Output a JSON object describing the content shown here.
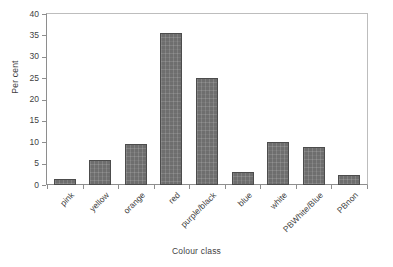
{
  "chart_data": {
    "type": "bar",
    "title": "",
    "xlabel": "Colour class",
    "ylabel": "Per cent",
    "categories": [
      "pink",
      "yellow",
      "orange",
      "red",
      "purple/black",
      "blue",
      "white",
      "PBWhite/Blue",
      "PBnon"
    ],
    "values": [
      1.3,
      5.8,
      9.5,
      35.5,
      25.0,
      3.0,
      10.0,
      8.8,
      2.3
    ],
    "ylim": [
      0,
      40
    ],
    "yticks": [
      0,
      5,
      10,
      15,
      20,
      25,
      30,
      35,
      40
    ],
    "ytick_labels": [
      "0",
      "5",
      "10",
      "15",
      "20",
      "25",
      "30",
      "35",
      "40"
    ],
    "grid": false,
    "legend": false,
    "legend_position": "none",
    "bar_color": "#6e6e6e",
    "bar_edge_color": "#4c4c4c",
    "axis_color": "#8e8e8e",
    "text_color": "#3f3f3f"
  }
}
